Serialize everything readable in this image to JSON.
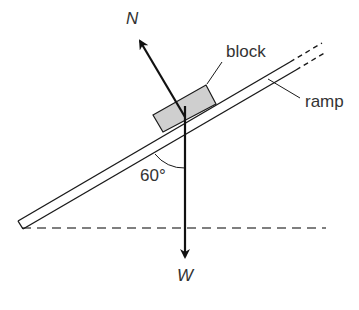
{
  "diagram": {
    "type": "free-body diagram on inclined ramp",
    "labels": {
      "normal_force": "N",
      "weight": "W",
      "block": "block",
      "ramp": "ramp",
      "angle": "60°"
    },
    "colors": {
      "line": "#1a1a1a",
      "block_fill": "#cfcfcf",
      "text": "#333333",
      "dashed": "#555555"
    }
  }
}
